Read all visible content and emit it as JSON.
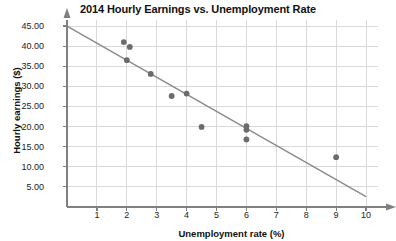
{
  "chart_data": {
    "type": "scatter",
    "title": "2014 Hourly Earnings vs. Unemployment Rate",
    "xlabel": "Unemployment rate (%)",
    "ylabel": "Hourly earnings ($)",
    "xlim": [
      0,
      10.4
    ],
    "ylim": [
      0,
      46.5
    ],
    "grid": true,
    "legend": "none",
    "xticks": [
      1,
      2,
      3,
      4,
      5,
      6,
      7,
      8,
      9,
      10
    ],
    "xtick_labels": [
      "1",
      "2",
      "3",
      "4",
      "5",
      "6",
      "7",
      "8",
      "9",
      "10"
    ],
    "yticks": [
      5,
      10,
      15,
      20,
      25,
      30,
      35,
      40,
      45
    ],
    "ytick_labels": [
      "5.00",
      "10.00",
      "15.00",
      "20.00",
      "25.00",
      "30.00",
      "35.00",
      "40.00",
      "45.00"
    ],
    "points": [
      {
        "x": 1.9,
        "y": 41.0
      },
      {
        "x": 2.1,
        "y": 39.8
      },
      {
        "x": 2.0,
        "y": 36.5
      },
      {
        "x": 2.8,
        "y": 33.1
      },
      {
        "x": 3.5,
        "y": 27.6
      },
      {
        "x": 4.0,
        "y": 28.2
      },
      {
        "x": 4.5,
        "y": 19.9
      },
      {
        "x": 6.0,
        "y": 20.1
      },
      {
        "x": 6.0,
        "y": 19.2
      },
      {
        "x": 6.0,
        "y": 16.8
      },
      {
        "x": 9.0,
        "y": 12.4
      }
    ],
    "trendline": {
      "x1": 0.0,
      "y1": 45.0,
      "x2": 10.0,
      "y2": 2.6
    },
    "colors": {
      "point": "#6b6b6b",
      "trendline": "#8a8a8a",
      "grid": "#d9d9d9",
      "axis": "#808080",
      "text": "#111111",
      "background": "#ffffff"
    }
  }
}
